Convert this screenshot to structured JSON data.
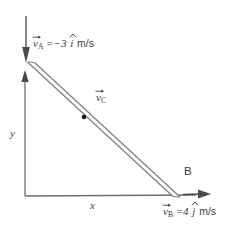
{
  "figure": {
    "background_color": "#ffffff",
    "line_color": "#6e6e6e",
    "text_color": "#3c3c3c"
  },
  "axes": {
    "x_label": "x",
    "y_label": "y",
    "origin": {
      "x": 25,
      "y": 196
    },
    "x_axis_end": {
      "x": 210,
      "y": 196
    },
    "y_axis_end": {
      "x": 25,
      "y": 72
    }
  },
  "labels": {
    "point_b": "B",
    "v_a": {
      "symbol": "v",
      "subscript": "A",
      "equals": "=",
      "value": "−3",
      "unit_vector": "i",
      "units": "m/s",
      "full_text": "v⃗A = −3 î m/s"
    },
    "v_b": {
      "symbol": "v",
      "subscript": "B",
      "equals": "=",
      "value": "4",
      "unit_vector": "j",
      "units": "m/s",
      "full_text": "v⃗B = 4 ĵ m/s"
    },
    "v_c": {
      "symbol": "v",
      "subscript": "C",
      "full_text": "v⃗C"
    }
  },
  "rod": {
    "top_point": {
      "x": 28,
      "y": 63
    },
    "bottom_point": {
      "x": 176,
      "y": 197
    },
    "point_c": {
      "x": 84,
      "y": 117
    }
  },
  "arrows": {
    "v_a_arrow": {
      "direction": "down",
      "x": 26,
      "y_start": 16,
      "y_end": 63
    },
    "v_b_arrow": {
      "direction": "right",
      "y": 194,
      "x_start": 186,
      "x_end": 211
    }
  }
}
